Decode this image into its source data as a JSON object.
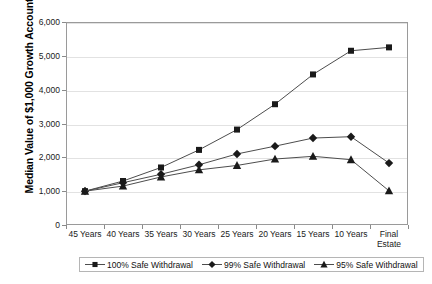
{
  "chart_data": {
    "type": "line",
    "title": "",
    "xlabel": "",
    "ylabel": "Median Value of $1,000 Growth Account",
    "categories": [
      "45 Years",
      "40 Years",
      "35 Years",
      "30 Years",
      "25 Years",
      "20 Years",
      "15 Years",
      "10 Years",
      "Final Estate"
    ],
    "x_tick_labels": [
      {
        "line1": "45 Years",
        "line2": ""
      },
      {
        "line1": "40 Years",
        "line2": ""
      },
      {
        "line1": "35 Years",
        "line2": ""
      },
      {
        "line1": "30 Years",
        "line2": ""
      },
      {
        "line1": "25 Years",
        "line2": ""
      },
      {
        "line1": "20 Years",
        "line2": ""
      },
      {
        "line1": "15 Years",
        "line2": ""
      },
      {
        "line1": "10 Years",
        "line2": ""
      },
      {
        "line1": "Final",
        "line2": "Estate"
      }
    ],
    "ylim": [
      0,
      6000
    ],
    "y_ticks": [
      0,
      1000,
      2000,
      3000,
      4000,
      5000,
      6000
    ],
    "y_tick_labels": [
      "0",
      "1,000",
      "2,000",
      "3,000",
      "4,000",
      "5,000",
      "6,000"
    ],
    "grid": true,
    "legend_position": "bottom",
    "series": [
      {
        "name": "100% Safe Withdrawal",
        "marker": "square",
        "color": "#1a1a1a",
        "values": [
          1000,
          1300,
          1700,
          2220,
          2820,
          3570,
          4450,
          5150,
          5250
        ]
      },
      {
        "name": "99% Safe Withdrawal",
        "marker": "diamond",
        "color": "#1a1a1a",
        "values": [
          1000,
          1250,
          1500,
          1780,
          2100,
          2330,
          2570,
          2610,
          1830
        ]
      },
      {
        "name": "95% Safe Withdrawal",
        "marker": "triangle",
        "color": "#1a1a1a",
        "values": [
          1000,
          1150,
          1420,
          1630,
          1760,
          1950,
          2030,
          1930,
          1010
        ]
      }
    ]
  },
  "legend": {
    "items": [
      {
        "label": "100% Safe Withdrawal",
        "marker": "square"
      },
      {
        "label": "99% Safe Withdrawal",
        "marker": "diamond"
      },
      {
        "label": "95% Safe Withdrawal",
        "marker": "triangle"
      }
    ]
  },
  "colors": {
    "plot_border": "#9a9a9a",
    "gridline": "#e2e2e2",
    "line": "#4d4d4d",
    "marker": "#1a1a1a",
    "background": "#ffffff"
  }
}
